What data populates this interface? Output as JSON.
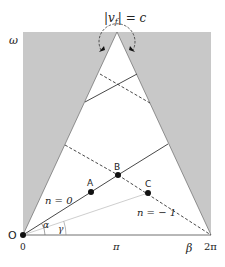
{
  "diagram": {
    "title_label": "|v_f| = c",
    "title_parts": {
      "open": "|",
      "v": "v",
      "sub": "f",
      "close": "| = c"
    },
    "axis": {
      "y_label": "ω",
      "x_label": "β",
      "x_ticks": [
        "0",
        "π",
        "2π"
      ]
    },
    "origin_label": "O",
    "points": {
      "A": "A",
      "B": "B",
      "C": "C"
    },
    "line_labels": {
      "n0": "n = 0",
      "nm1": "n = − 1"
    },
    "angles": {
      "alpha": "α",
      "gamma": "γ"
    },
    "colors": {
      "shaded": "#c8c8c8",
      "line": "#333333",
      "gray_line": "#bbbbbb",
      "point": "#111111"
    }
  }
}
